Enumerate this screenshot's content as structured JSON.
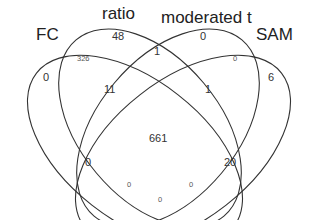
{
  "diagram": {
    "type": "venn-4",
    "sets": [
      {
        "key": "fc",
        "label": "FC"
      },
      {
        "key": "ratio",
        "label": "ratio"
      },
      {
        "key": "modt",
        "label": "moderated t"
      },
      {
        "key": "sam",
        "label": "SAM"
      }
    ],
    "regions": {
      "fc_only": "0",
      "ratio_only": "48",
      "modt_only": "0",
      "sam_only": "6",
      "fc_ratio": "326",
      "ratio_modt": "1",
      "modt_sam": "0",
      "fc_ratio_modt": "11",
      "ratio_modt_sam": "1",
      "all_four": "661",
      "fc_modt_sam_left": "0",
      "fc_ratio_sam": "20",
      "fc_sam_small_left": "0",
      "fc_sam_small_right": "0",
      "fc_sam_bottom": "0"
    }
  }
}
